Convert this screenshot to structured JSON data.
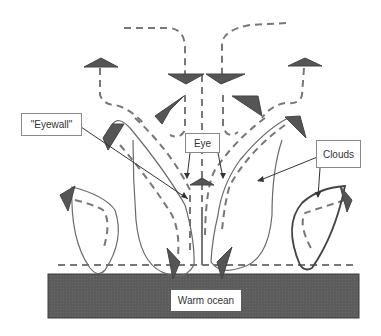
{
  "diagram": {
    "labels": {
      "eyewall": "\"Eyewall\"",
      "eye": "Eye",
      "clouds": "Clouds",
      "ocean": "Warm ocean"
    },
    "colors": {
      "ocean_fill": "#5a5a5a",
      "arrow_fill": "#555555",
      "dashed_flow": "#777777",
      "cloud_outline": "#666666",
      "pointer_line": "#333333"
    },
    "legend_semantics": {
      "dashed_lines": "air flow",
      "solid_outlines": "cloud boundaries",
      "triangles": "flow direction arrowheads"
    }
  }
}
